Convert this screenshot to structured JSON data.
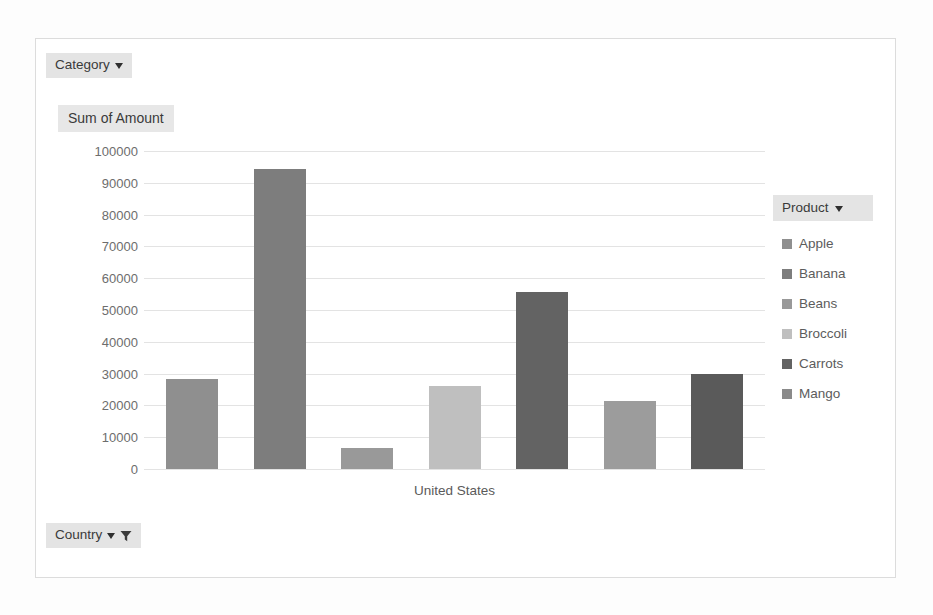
{
  "window": {
    "background_color": "#fdfdfd",
    "frame_border_color": "#dcdcdc"
  },
  "category_button": {
    "label": "Category",
    "icon": "chevron-down-icon"
  },
  "country_button": {
    "label": "Country",
    "icon": "chevron-down-icon",
    "filter_icon": "funnel-filter-icon",
    "filter_active": true
  },
  "legend": {
    "header_label": "Product",
    "header_icon": "chevron-down-icon",
    "items": [
      {
        "label": "Apple",
        "color": "#8f8f8f"
      },
      {
        "label": "Banana",
        "color": "#7d7d7d"
      },
      {
        "label": "Beans",
        "color": "#999999"
      },
      {
        "label": "Broccoli",
        "color": "#bfbfbf"
      },
      {
        "label": "Carrots",
        "color": "#636363"
      },
      {
        "label": "Mango",
        "color": "#8a8a8a"
      }
    ]
  },
  "chart_data": {
    "type": "bar",
    "title": "Sum of Amount",
    "xlabel": "United States",
    "ylabel": "",
    "ylim": [
      0,
      100000
    ],
    "grid": true,
    "legend_position": "right",
    "categories": [
      "Apple",
      "Banana",
      "Beans",
      "Broccoli",
      "Carrots",
      "Mango",
      "Mango"
    ],
    "values": [
      28200,
      94200,
      6500,
      26000,
      55600,
      21500,
      30000
    ],
    "bar_colors": [
      "#8f8f8f",
      "#7d7d7d",
      "#999999",
      "#bfbfbf",
      "#636363",
      "#9c9c9c",
      "#5a5a5a"
    ],
    "ytick_labels": [
      "100000",
      "90000",
      "80000",
      "70000",
      "60000",
      "50000",
      "40000",
      "30000",
      "20000",
      "10000",
      "0"
    ],
    "ytick_values": [
      100000,
      90000,
      80000,
      70000,
      60000,
      50000,
      40000,
      30000,
      20000,
      10000,
      0
    ],
    "xtick_labels": [
      "United States"
    ],
    "gridline_color": "#e3e3e3"
  }
}
